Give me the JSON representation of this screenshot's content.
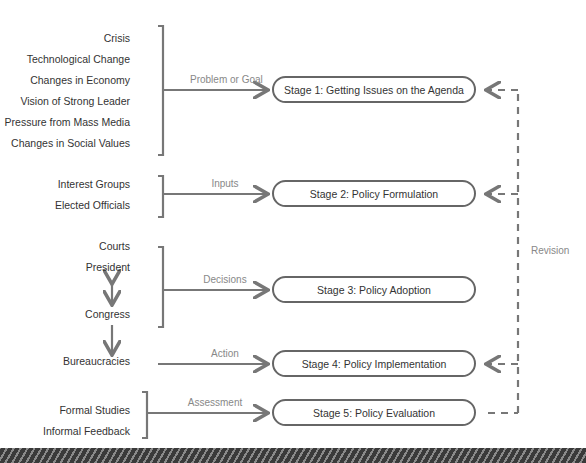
{
  "groups": [
    {
      "items": [
        "Crisis",
        "Technological Change",
        "Changes in Economy",
        "Vision of Strong Leader",
        "Pressure from Mass Media",
        "Changes in Social Values"
      ],
      "flow_label": "Problem or Goal"
    },
    {
      "items": [
        "Interest Groups",
        "Elected Officials"
      ],
      "flow_label": "Inputs"
    },
    {
      "items": [
        "Courts",
        "President",
        "Congress"
      ],
      "flow_label": "Decisions"
    },
    {
      "items": [
        "Bureaucracies"
      ],
      "flow_label": "Action"
    },
    {
      "items": [
        "Formal Studies",
        "Informal Feedback"
      ],
      "flow_label": "Assessment"
    }
  ],
  "stages": [
    {
      "label": "Stage 1: Getting Issues on the Agenda"
    },
    {
      "label": "Stage 2: Policy Formulation"
    },
    {
      "label": "Stage 3: Policy Adoption"
    },
    {
      "label": "Stage 4: Policy Implementation"
    },
    {
      "label": "Stage 5: Policy Evaluation"
    }
  ],
  "feedback_label": "Revision",
  "colors": {
    "line": "#777777",
    "text": "#333333",
    "muted": "#888888"
  }
}
